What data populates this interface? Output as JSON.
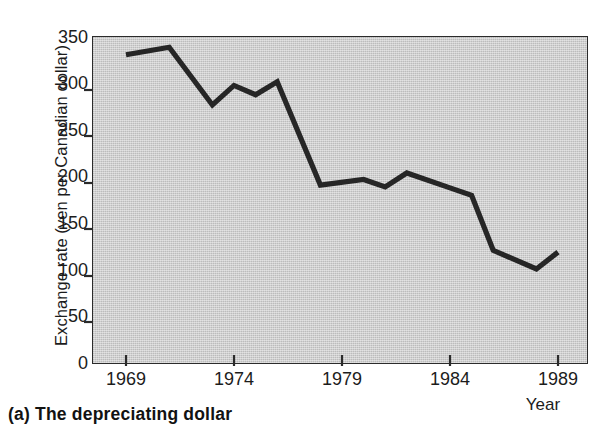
{
  "caption": "(a) The depreciating dollar",
  "chart_data": {
    "type": "line",
    "title": "",
    "xlabel": "Year",
    "ylabel": "Exchange rate (yen per Canadian dollar)",
    "xlim": [
      1968.2,
      1990.1
    ],
    "ylim": [
      0,
      350
    ],
    "xticks": [
      "1969",
      "1974",
      "1979",
      "1984",
      "1989"
    ],
    "xtick_values": [
      1969,
      1974,
      1979,
      1984,
      1989
    ],
    "yticks": [
      "0",
      "50",
      "100",
      "150",
      "200",
      "250",
      "300",
      "350"
    ],
    "ytick_values": [
      0,
      50,
      100,
      150,
      200,
      250,
      300,
      350
    ],
    "grid": false,
    "legend": false,
    "plot_background": "#cfcfcf",
    "line_color": "#262626",
    "line_width": 5,
    "x": [
      1969,
      1970,
      1971,
      1973,
      1974,
      1975,
      1976,
      1978,
      1980,
      1981,
      1982,
      1984,
      1985,
      1986,
      1988,
      1989
    ],
    "values": [
      331,
      335,
      339,
      277,
      298,
      288,
      302,
      191,
      197,
      189,
      204,
      188,
      180,
      121,
      101,
      119
    ],
    "series": [
      {
        "name": "Exchange rate (yen per Canadian dollar)",
        "points": [
          {
            "x": 1969,
            "y": 331
          },
          {
            "x": 1970,
            "y": 335
          },
          {
            "x": 1971,
            "y": 339
          },
          {
            "x": 1973,
            "y": 277
          },
          {
            "x": 1974,
            "y": 298
          },
          {
            "x": 1975,
            "y": 288
          },
          {
            "x": 1976,
            "y": 302
          },
          {
            "x": 1978,
            "y": 191
          },
          {
            "x": 1980,
            "y": 197
          },
          {
            "x": 1981,
            "y": 189
          },
          {
            "x": 1982,
            "y": 204
          },
          {
            "x": 1984,
            "y": 188
          },
          {
            "x": 1985,
            "y": 180
          },
          {
            "x": 1986,
            "y": 121
          },
          {
            "x": 1988,
            "y": 101
          },
          {
            "x": 1989,
            "y": 119
          }
        ]
      }
    ]
  }
}
